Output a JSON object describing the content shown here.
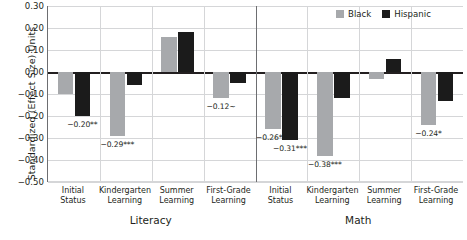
{
  "chart_data": {
    "type": "bar",
    "title": "",
    "ylabel": "Standardized (Effect Size) Units",
    "xlabel": "",
    "ylim": [
      -0.5,
      0.3
    ],
    "ytick_step": 0.1,
    "yticks": [
      "0.30",
      "0.20",
      "0.10",
      "0.00",
      "-0.10",
      "-0.20",
      "-0.30",
      "-0.40",
      "-0.50"
    ],
    "grid": true,
    "legend_position": "top-right",
    "categories": [
      "Initial Status",
      "Kindergarten Learning",
      "Summer Learning",
      "First-Grade Learning"
    ],
    "category_lines": [
      [
        "Initial",
        "Status"
      ],
      [
        "Kindergarten",
        "Learning"
      ],
      [
        "Summer",
        "Learning"
      ],
      [
        "First-Grade",
        "Learning"
      ]
    ],
    "panels": [
      {
        "name": "Literacy",
        "series": [
          {
            "name": "Black",
            "values": [
              -0.1,
              -0.29,
              0.16,
              -0.12
            ],
            "labels": [
              "",
              "-0.29***",
              "",
              "-0.12~"
            ]
          },
          {
            "name": "Hispanic",
            "values": [
              -0.2,
              -0.06,
              0.18,
              -0.05
            ],
            "labels": [
              "-0.20**",
              "",
              "",
              ""
            ]
          }
        ]
      },
      {
        "name": "Math",
        "series": [
          {
            "name": "Black",
            "values": [
              -0.26,
              -0.38,
              -0.03,
              -0.24
            ],
            "labels": [
              "-0.26***",
              "-0.38***",
              "",
              "-0.24*"
            ]
          },
          {
            "name": "Hispanic",
            "values": [
              -0.31,
              -0.12,
              0.06,
              -0.13
            ],
            "labels": [
              "-0.31***",
              "",
              "",
              ""
            ]
          }
        ]
      }
    ],
    "legend": [
      {
        "label": "Black",
        "color": "#a7a9ac"
      },
      {
        "label": "Hispanic",
        "color": "#1b1b1b"
      }
    ]
  }
}
